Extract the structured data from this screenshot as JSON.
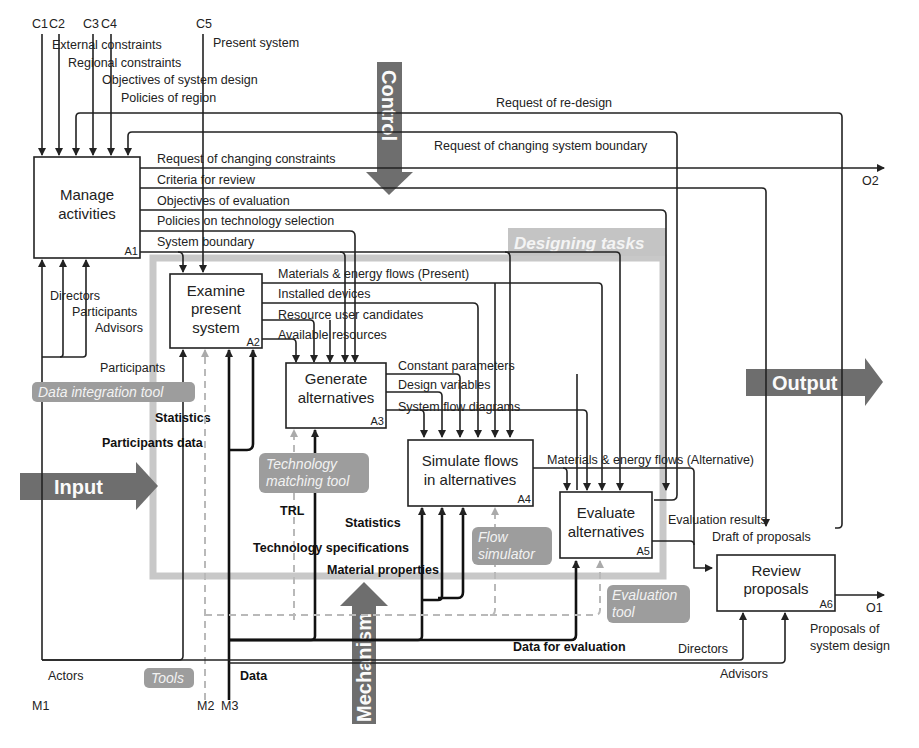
{
  "figure": {
    "type": "IDEF0 activity diagram",
    "controls_ids": {
      "c1": "C1",
      "c2": "C2",
      "c3": "C3",
      "c4": "C4",
      "c5": "C5"
    },
    "controls": {
      "external_constraints": "External constraints",
      "regional_constraints": "Regional constraints",
      "objectives_of_system_design": "Objectives of system design",
      "policies_of_region": "Policies of region",
      "present_system": "Present system"
    },
    "mechanism_ids": {
      "m1": "M1",
      "m2": "M2",
      "m3": "M3"
    },
    "mechanisms": {
      "actors": "Actors",
      "tools": "Tools",
      "data": "Data"
    },
    "output_ids": {
      "o1": "O1",
      "o2": "O2"
    },
    "big_arrows": {
      "control": "Control",
      "input": "Input",
      "output": "Output",
      "mechanism": "Mechanism"
    },
    "group_label": "Designing tasks",
    "activities": [
      {
        "id": "A1",
        "line1": "Manage",
        "line2": "activities",
        "line3": ""
      },
      {
        "id": "A2",
        "line1": "Examine",
        "line2": "present",
        "line3": "system"
      },
      {
        "id": "A3",
        "line1": "Generate",
        "line2": "alternatives",
        "line3": ""
      },
      {
        "id": "A4",
        "line1": "Simulate flows",
        "line2": "in alternatives",
        "line3": ""
      },
      {
        "id": "A5",
        "line1": "Evaluate",
        "line2": "alternatives",
        "line3": ""
      },
      {
        "id": "A6",
        "line1": "Review",
        "line2": "proposals",
        "line3": ""
      }
    ],
    "feedback": {
      "request_redesign": "Request of re-design",
      "request_changing_boundary": "Request of changing system boundary"
    },
    "a1_outputs": {
      "request_changing_constraints": "Request of changing constraints",
      "criteria_for_review": "Criteria for review",
      "objectives_of_evaluation": "Objectives of evaluation",
      "policies_on_technology_selection": "Policies on technology selection",
      "system_boundary": "System boundary"
    },
    "a1_mechanisms": {
      "directors": "Directors",
      "participants": "Participants",
      "advisors": "Advisors"
    },
    "a2_outputs": {
      "materials_present": "Materials & energy flows (Present)",
      "installed_devices": "Installed devices",
      "resource_user_candidates": "Resource user candidates",
      "available_resources": "Available resources"
    },
    "a2_mechanisms": {
      "participants": "Participants",
      "statistics": "Statistics",
      "participants_data": "Participants data"
    },
    "a3_outputs": {
      "constant_parameters": "Constant parameters",
      "design_variables": "Design variables",
      "system_flow_diagrams": "System flow diagrams"
    },
    "a3_mechanisms": {
      "trl": "TRL",
      "technology_specifications": "Technology specifications"
    },
    "a4_outputs": {
      "materials_alternative": "Materials & energy flows (Alternative)"
    },
    "a4_mechanisms": {
      "statistics": "Statistics",
      "material_properties": "Material properties"
    },
    "a5_outputs": {
      "evaluation_results": "Evaluation results",
      "draft_of_proposals": "Draft of proposals"
    },
    "a5_mechanisms": {
      "data_for_evaluation": "Data for evaluation"
    },
    "a6_outputs": {
      "proposals_line1": "Proposals of",
      "proposals_line2": "system design"
    },
    "a6_mechanisms": {
      "directors": "Directors",
      "advisors": "Advisors"
    },
    "tools": {
      "data_integration": "Data integration tool",
      "tech_matching_line1": "Technology",
      "tech_matching_line2": "matching tool",
      "flow_sim_line1": "Flow",
      "flow_sim_line2": "simulator",
      "evaluation_line1": "Evaluation",
      "evaluation_line2": "tool"
    }
  }
}
